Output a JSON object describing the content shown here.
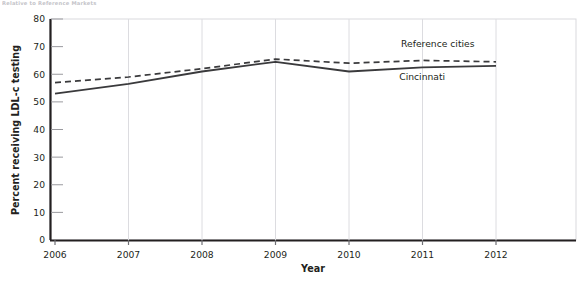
{
  "caption": "Relative to Reference Markets",
  "chart_data": {
    "type": "line",
    "title": "",
    "xlabel": "Year",
    "ylabel": "Percent receiving LDL-c testing",
    "categories": [
      "2006",
      "2007",
      "2008",
      "2009",
      "2010",
      "2011",
      "2012"
    ],
    "x": [
      2006,
      2007,
      2008,
      2009,
      2010,
      2011,
      2012
    ],
    "xlim": [
      2006,
      2012
    ],
    "ylim": [
      0,
      80
    ],
    "yticks": [
      0,
      10,
      20,
      30,
      40,
      50,
      60,
      70,
      80
    ],
    "grid": false,
    "legend_position": "inline-annotation",
    "series": [
      {
        "name": "Reference cities",
        "style": "dashed",
        "color": "#3a3a3c",
        "values": [
          57,
          59,
          62,
          65.5,
          64,
          65,
          64.5
        ]
      },
      {
        "name": "Cincinnati",
        "style": "solid",
        "color": "#3a3a3c",
        "values": [
          53,
          56.5,
          61,
          64.5,
          61,
          62.5,
          63
        ]
      }
    ],
    "annotations": [
      {
        "text": "Reference cities",
        "x": 2011,
        "y": 70
      },
      {
        "text": "Cincinnati",
        "x": 2010.6,
        "y": 58
      }
    ]
  },
  "axis": {
    "y_tick_labels": [
      "80",
      "70",
      "60",
      "50",
      "40",
      "30",
      "20",
      "10",
      "0"
    ],
    "x_tick_labels": [
      "2006",
      "2007",
      "2008",
      "2009",
      "2010",
      "2011",
      "2012"
    ],
    "x_title": "Year",
    "y_title": "Percent receiving LDL-c testing"
  }
}
